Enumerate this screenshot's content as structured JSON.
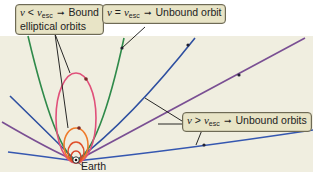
{
  "diagram": {
    "labels": {
      "bound": {
        "condition_var": "v",
        "condition_op": "<",
        "condition_rhs": "v",
        "condition_sub": "esc",
        "arrow": "➞",
        "line1_text": "Bound",
        "line2_text": "elliptical orbits"
      },
      "escape": {
        "condition_var": "v",
        "condition_op": "=",
        "condition_rhs": "v",
        "condition_sub": "esc",
        "arrow": "➞",
        "text": "Unbound orbit"
      },
      "unbound": {
        "condition_var": "v",
        "condition_op": ">",
        "condition_rhs": "v",
        "condition_sub": "esc",
        "arrow": "➞",
        "text": "Unbound orbits"
      },
      "earth": "Earth"
    },
    "colors": {
      "background_panel": "#f0eee0",
      "label_fill": "#e8e4c6",
      "ellipse_small_red": "#d8452b",
      "ellipse_orange": "#ee7a2a",
      "ellipse_pink": "#e0507a",
      "parabola_green": "#2f8a4a",
      "hyperbola_blue": "#2e4fa0",
      "hyperbola_purple": "#7a4f93",
      "hyperbola_flat_blue": "#3557b0"
    },
    "orbit_types": [
      "bound elliptical (small)",
      "bound elliptical (medium)",
      "bound elliptical (large)",
      "parabolic escape",
      "hyperbolic (steep)",
      "hyperbolic (medium)",
      "hyperbolic (flat)"
    ]
  }
}
